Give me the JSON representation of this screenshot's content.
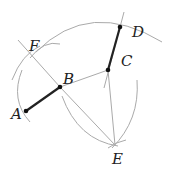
{
  "diagram": {
    "labels": {
      "A": "A",
      "B": "B",
      "C": "C",
      "D": "D",
      "E": "E",
      "F": "F"
    },
    "colors": {
      "segment": "#222222",
      "construction": "#aaaaaa",
      "point": "#111111"
    }
  }
}
